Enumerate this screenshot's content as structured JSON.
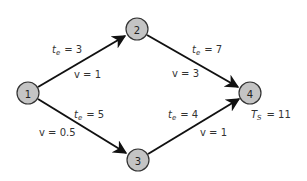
{
  "diagram": {
    "type": "network-activity-graph",
    "nodes": [
      {
        "id": "1",
        "label": "1",
        "x": 28,
        "y": 93
      },
      {
        "id": "2",
        "label": "2",
        "x": 137,
        "y": 29
      },
      {
        "id": "3",
        "label": "3",
        "x": 138,
        "y": 160
      },
      {
        "id": "4",
        "label": "4",
        "x": 250,
        "y": 93
      }
    ],
    "edges": [
      {
        "from": "1",
        "to": "2",
        "te_var": "t",
        "te_sub": "e",
        "te_value": "= 3",
        "v_label": "v = 1"
      },
      {
        "from": "2",
        "to": "4",
        "te_var": "t",
        "te_sub": "e",
        "te_value": "= 7",
        "v_label": "v = 3"
      },
      {
        "from": "1",
        "to": "3",
        "te_var": "t",
        "te_sub": "e",
        "te_value": "= 5",
        "v_label": "v = 0.5"
      },
      {
        "from": "3",
        "to": "4",
        "te_var": "t",
        "te_sub": "e",
        "te_value": "= 4",
        "v_label": "v = 1"
      }
    ],
    "annotation": {
      "var": "T",
      "sub": "S",
      "value": "= 11"
    },
    "colors": {
      "node_fill": "#c4c4c4",
      "node_stroke": "#333333",
      "edge": "#111111",
      "text": "#333333"
    }
  }
}
